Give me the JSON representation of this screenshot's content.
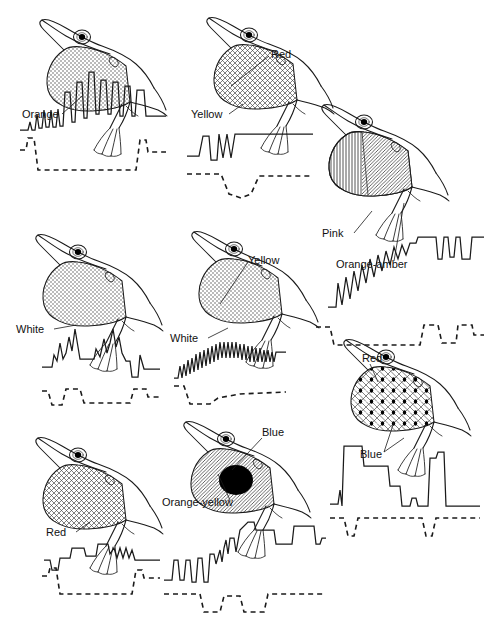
{
  "figure": {
    "line_color": "#1a1a1a",
    "label_color": "#111111",
    "background": "#ffffff",
    "panel_count": 8
  },
  "panels": [
    {
      "id": "panel-1",
      "position": {
        "x": 18,
        "y": 10,
        "w": 150,
        "h": 195
      },
      "labels": [
        {
          "name": "label-orange",
          "text": "Orange",
          "x": 4,
          "y": 108,
          "leader": [
            [
              44,
              104
            ],
            [
              64,
              86
            ]
          ]
        }
      ],
      "dewlap": {
        "patterns": [
          "stipple"
        ],
        "regions": 1
      },
      "waveform": {
        "type": "display-action-pattern",
        "solid": "M2,120 L10,120 L12,112 L14,120 L17,120 L19,104 L21,118 L24,118 L26,100 L28,117 L31,117 L33,100 L35,117 L38,117 L40,99 L42,116 L45,116 L47,82 L52,82 L54,112 L57,112 L59,72 L64,72 L66,108 L69,108 L71,62 L76,62 L78,104 L81,104 L83,70 L88,70 L90,104 L93,104 L95,72 L100,72 L102,106 L105,106 L107,76 L112,76 L114,106 L117,106 L119,80 L126,80 L128,106 L148,106",
        "dashed": "M2,140 L8,140 L10,128 L16,128 L20,160 L118,160 L122,130 L128,130 L130,142 L148,142"
      }
    },
    {
      "id": "panel-2",
      "position": {
        "x": 185,
        "y": 8,
        "w": 140,
        "h": 195
      },
      "labels": [
        {
          "name": "label-red",
          "text": "Red",
          "x": 86,
          "y": 50,
          "leader": [
            [
              84,
              48
            ],
            [
              46,
              78
            ]
          ]
        },
        {
          "name": "label-yellow",
          "text": "Yellow",
          "x": 6,
          "y": 110,
          "leader": [
            [
              44,
              106
            ],
            [
              58,
              96
            ]
          ]
        }
      ],
      "dewlap": {
        "patterns": [
          "crosshatch"
        ],
        "regions": 1
      },
      "waveform": {
        "type": "display-action-pattern",
        "solid": "M2,148 L14,148 L18,128 L24,128 L26,152 L32,152 L34,126 L38,150 L42,126 L46,150 L50,126 L128,126",
        "dashed": "M2,166 L36,166 L44,186 L56,190 L66,186 L74,168 L128,168"
      }
    },
    {
      "id": "panel-3",
      "position": {
        "x": 300,
        "y": 95,
        "w": 185,
        "h": 200
      },
      "labels": [
        {
          "name": "label-pink",
          "text": "Pink",
          "x": 22,
          "y": 142,
          "leader": [
            [
              54,
              138
            ],
            [
              72,
              116
            ]
          ]
        },
        {
          "name": "label-orange-amber",
          "text": "Orange-amber",
          "x": 36,
          "y": 173,
          "leader": [
            [
              94,
              166
            ],
            [
              104,
              108
            ]
          ]
        }
      ],
      "dewlap": {
        "patterns": [
          "vertical-lines",
          "diagonal-hatch"
        ],
        "regions": 2
      },
      "waveform": {
        "type": "display-action-pattern",
        "solid": "M28,212 L36,212 L38,188 L42,210 L46,182 L50,204 L54,176 L58,196 L62,170 L66,188 L70,164 L74,182 L78,160 L82,176 L86,156 L90,170 L94,152 L98,164 L102,150 L106,160 L110,148 L116,148 L118,142 L136,142 L138,164 L142,164 L144,142 L148,142 L150,162 L154,162 L156,142 L160,142 L162,164 L170,164 L172,142 L184,142",
        "dashed": "M16,232 L30,232 L34,250 L120,250 L124,230 L138,230 L142,248 L156,248 L158,230 L172,230 L174,240 L184,240"
      }
    },
    {
      "id": "panel-4",
      "position": {
        "x": 14,
        "y": 225,
        "w": 150,
        "h": 180
      },
      "labels": [
        {
          "name": "label-white",
          "text": "White",
          "x": 2,
          "y": 108,
          "leader": [
            [
              40,
              104
            ],
            [
              62,
              100
            ]
          ]
        }
      ],
      "dewlap": {
        "patterns": [
          "stipple"
        ],
        "regions": 1
      },
      "waveform": {
        "type": "display-action-pattern",
        "solid": "M28,142 L38,142 L40,130 L43,136 L46,118 L49,134 L52,128 L55,112 L58,126 L61,104 L64,122 L66,134 L80,134 L82,124 L86,132 L90,114 L93,128 L96,118 L99,104 L102,122 L105,112 L108,128 L112,136 L116,136 L118,152 L124,152 L126,130 L130,144 L146,144",
        "dashed": "M28,166 L34,166 L38,180 L48,180 L52,164 L66,164 L70,178 L116,178 L120,164 L132,164 L134,172 L146,172"
      }
    },
    {
      "id": "panel-5",
      "position": {
        "x": 170,
        "y": 222,
        "w": 150,
        "h": 185
      },
      "labels": [
        {
          "name": "label-yellow",
          "text": "Yellow",
          "x": 78,
          "y": 42,
          "leader": [
            [
              78,
              40
            ],
            [
              50,
              82
            ]
          ]
        },
        {
          "name": "label-white",
          "text": "White",
          "x": 0,
          "y": 120,
          "leader": [
            [
              38,
              116
            ],
            [
              58,
              106
            ]
          ]
        }
      ],
      "dewlap": {
        "patterns": [
          "stipple"
        ],
        "regions": 1
      },
      "waveform": {
        "type": "display-action-pattern",
        "solid": "M4,156 L8,156 L10,144 L12,156 L14,142 L16,154 L18,138 L20,152 L22,136 L24,150 L26,132 L28,148 L30,130 L32,146 L34,128 L36,144 L38,126 L40,142 L42,124 L44,140 L46,122 L48,138 L50,120 L52,136 L54,120 L56,136 L58,120 L60,136 L62,120 L64,136 L66,120 L68,136 L70,122 L72,138 L74,122 L76,138 L78,124 L80,140 L82,124 L84,140 L86,126 L88,140 L90,126 L92,140 L94,128 L96,140 L98,128 L100,140 L102,130 L104,140 L106,130 L116,130",
        "dashed": "M4,164 L14,164 L20,182 L40,182 L48,176 L70,172 L116,170"
      }
    },
    {
      "id": "panel-6",
      "position": {
        "x": 322,
        "y": 330,
        "w": 165,
        "h": 190
      },
      "labels": [
        {
          "name": "label-red",
          "text": "Red",
          "x": 40,
          "y": 32,
          "leader": [
            [
              48,
              34
            ],
            [
              56,
              52
            ]
          ]
        },
        {
          "name": "label-blue",
          "text": "Blue",
          "x": 38,
          "y": 128,
          "leader": [
            [
              62,
              122
            ],
            [
              82,
              108
            ]
          ],
          "leader2": [
            [
              62,
              122
            ],
            [
              72,
              92
            ]
          ]
        }
      ],
      "dewlap": {
        "patterns": [
          "crosshatch",
          "black-dots"
        ],
        "regions": 1
      },
      "waveform": {
        "type": "display-action-pattern",
        "solid": "M8,174 L16,174 L18,160 L20,176 L22,116 L40,116 L42,136 L66,136 L68,156 L78,156 L80,176 L88,176 L90,168 L94,168 L96,176 L106,176 L108,128 L114,128 L116,122 L122,122 L124,176 L158,176",
        "dashed": "M8,188 L22,188 L26,206 L32,206 L36,188 L100,188 L104,206 L110,206 L114,188 L158,188"
      }
    },
    {
      "id": "panel-7",
      "position": {
        "x": 14,
        "y": 428,
        "w": 150,
        "h": 185
      },
      "labels": [
        {
          "name": "label-red",
          "text": "Red",
          "x": 32,
          "y": 108,
          "leader": [
            [
              62,
              104
            ],
            [
              76,
              94
            ]
          ]
        }
      ],
      "dewlap": {
        "patterns": [
          "crosshatch"
        ],
        "regions": 1
      },
      "waveform": {
        "type": "display-action-pattern",
        "solid": "M30,132 L36,132 L38,142 L44,142 L46,130 L56,130 L58,120 L70,120 L72,128 L82,128 L84,116 L94,116 L96,126 L100,120 L103,130 L106,120 L109,130 L112,120 L115,130 L118,122 L121,132 L146,132",
        "dashed": "M28,148 L34,148 L36,140 L42,140 L46,166 L118,166 L122,142 L128,142 L130,150 L146,150"
      }
    },
    {
      "id": "panel-8",
      "position": {
        "x": 162,
        "y": 412,
        "w": 165,
        "h": 200
      },
      "labels": [
        {
          "name": "label-blue",
          "text": "Blue",
          "x": 100,
          "y": 24,
          "leader": [
            [
              100,
              26
            ],
            [
              70,
              58
            ]
          ]
        },
        {
          "name": "label-orange-yellow",
          "text": "Orange-yellow",
          "x": 0,
          "y": 94,
          "leader": [
            [
              68,
              88
            ],
            [
              56,
              62
            ]
          ]
        }
      ],
      "dewlap": {
        "patterns": [
          "diagonal-hatch",
          "solid-black-spot"
        ],
        "regions": 2
      },
      "waveform": {
        "type": "display-action-pattern",
        "solid": "M2,168 L10,168 L12,148 L16,148 L18,168 L22,168 L24,148 L28,148 L30,170 L34,170 L36,146 L40,146 L42,170 L46,170 L48,142 L52,142 L54,152 L58,138 L60,150 L62,136 L64,128 L66,142 L68,126 L72,126 L74,140 L78,118 L86,110 L92,110 L94,118 L112,118 L114,132 L130,132 L132,114 L152,114 L154,132 L158,132 L160,126 L164,126",
        "dashed": "M2,182 L38,182 L42,200 L58,200 L62,184 L78,184 L82,200 L102,200 L106,182 L164,182"
      }
    }
  ]
}
